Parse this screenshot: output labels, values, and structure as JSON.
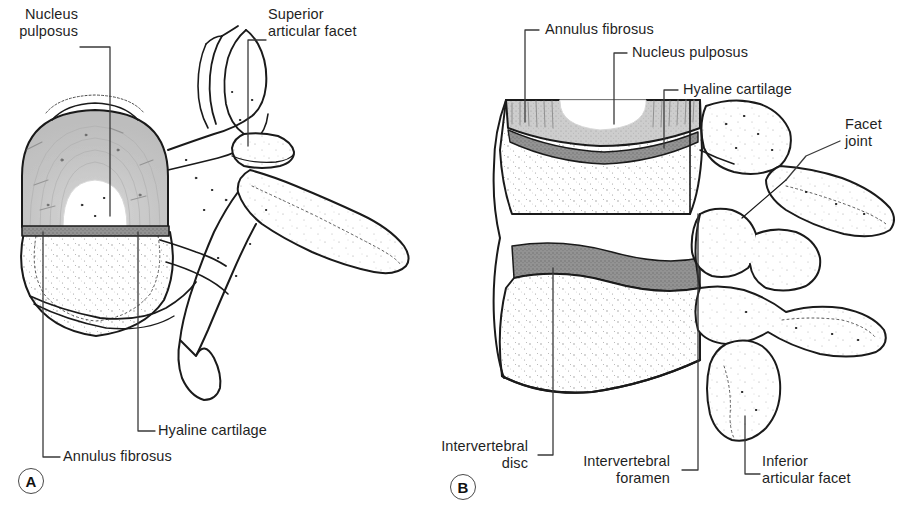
{
  "figure": {
    "background_color": "#ffffff",
    "line_color": "#1a1a1a",
    "annulus_fill": "#c9c9c9",
    "cartilage_fill": "#8f8f8f",
    "nucleus_fill": "#ffffff",
    "bone_fill": "#ffffff"
  },
  "panels": [
    {
      "letter": "A",
      "view": "superior view of vertebra with intervertebral disc",
      "labels": [
        {
          "id": "nucleus-pulposus",
          "text": "Nucleus\npulposus",
          "align": "right"
        },
        {
          "id": "superior-articular-facet",
          "text": "Superior\narticular facet",
          "align": "left"
        },
        {
          "id": "hyaline-cartilage",
          "text": "Hyaline cartilage",
          "align": "left"
        },
        {
          "id": "annulus-fibrosus",
          "text": "Annulus fibrosus",
          "align": "left"
        }
      ]
    },
    {
      "letter": "B",
      "view": "lateral view of two vertebrae with intervertebral disc",
      "labels": [
        {
          "id": "annulus-fibrosus",
          "text": "Annulus fibrosus",
          "align": "left"
        },
        {
          "id": "nucleus-pulposus",
          "text": "Nucleus pulposus",
          "align": "left"
        },
        {
          "id": "hyaline-cartilage",
          "text": "Hyaline cartilage",
          "align": "left"
        },
        {
          "id": "facet-joint",
          "text": "Facet\njoint",
          "align": "left"
        },
        {
          "id": "intervertebral-disc",
          "text": "Intervertebral\ndisc",
          "align": "right"
        },
        {
          "id": "intervertebral-foramen",
          "text": "Intervertebral\nforamen",
          "align": "right"
        },
        {
          "id": "inferior-articular-facet",
          "text": "Inferior\narticular facet",
          "align": "left"
        }
      ]
    }
  ],
  "labels_flat": {
    "a_nucleus_pulposus": "Nucleus\npulposus",
    "a_superior_articular_facet": "Superior\narticular facet",
    "a_hyaline_cartilage": "Hyaline cartilage",
    "a_annulus_fibrosus": "Annulus fibrosus",
    "a_letter": "A",
    "b_annulus_fibrosus": "Annulus fibrosus",
    "b_nucleus_pulposus": "Nucleus pulposus",
    "b_hyaline_cartilage": "Hyaline cartilage",
    "b_facet_joint": "Facet\njoint",
    "b_intervertebral_disc": "Intervertebral\ndisc",
    "b_intervertebral_foramen": "Intervertebral\nforamen",
    "b_inferior_articular_facet": "Inferior\narticular facet",
    "b_letter": "B"
  }
}
